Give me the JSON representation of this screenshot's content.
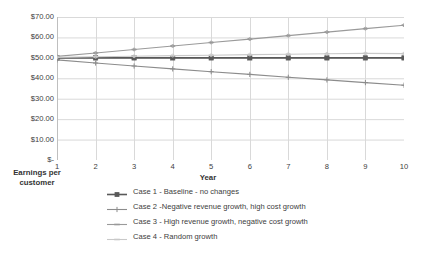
{
  "chart_data": {
    "type": "line",
    "title": "",
    "xlabel": "Year",
    "ylabel": "Earnings per customer",
    "x": [
      1,
      2,
      3,
      4,
      5,
      6,
      7,
      8,
      9,
      10
    ],
    "x_tick_labels": [
      "1",
      "2",
      "3",
      "4",
      "5",
      "6",
      "7",
      "8",
      "9",
      "10"
    ],
    "y_tick_labels": [
      "$70.00",
      "$60.00",
      "$50.00",
      "$40.00",
      "$30.00",
      "$20.00",
      "$10.00",
      "$-"
    ],
    "y_tick_values": [
      70,
      60,
      50,
      40,
      30,
      20,
      10,
      0
    ],
    "ylim": [
      0,
      70
    ],
    "xlim": [
      1,
      10
    ],
    "grid": true,
    "legend_position": "bottom",
    "series": [
      {
        "name": "Case 1 - Baseline - no changes",
        "color": "#595959",
        "marker": "square",
        "values": [
          50.0,
          50.0,
          50.0,
          50.0,
          50.0,
          50.0,
          50.0,
          50.0,
          50.0,
          50.0
        ]
      },
      {
        "name": "Case 2 -Negative revenue growth, high cost growth",
        "color": "#8c8c8c",
        "marker": "plus",
        "values": [
          49.0,
          47.5,
          46.0,
          44.6,
          43.2,
          41.9,
          40.5,
          39.2,
          37.9,
          36.6
        ]
      },
      {
        "name": "Case 3 - High revenue growth, negative cost growth",
        "color": "#9a9a9a",
        "marker": "dash",
        "values": [
          50.7,
          52.4,
          54.1,
          55.8,
          57.5,
          59.2,
          60.9,
          62.6,
          64.3,
          66.0
        ]
      },
      {
        "name": "Case 4 - Random growth",
        "color": "#c9c9c9",
        "marker": "dash",
        "values": [
          50.2,
          50.5,
          50.8,
          51.1,
          51.3,
          51.6,
          51.8,
          52.0,
          52.2,
          52.1
        ]
      }
    ]
  },
  "legend": {
    "items": [
      {
        "label": "Case 1 - Baseline - no changes"
      },
      {
        "label": "Case 2 -Negative revenue growth, high cost growth"
      },
      {
        "label": "Case 3 - High revenue growth, negative cost growth"
      },
      {
        "label": "Case 4 - Random growth"
      }
    ]
  },
  "axes": {
    "x_title": "Year",
    "y_title_line1": "Earnings per",
    "y_title_line2": "customer"
  },
  "colors": {
    "grid": "#d9d9d9",
    "axis": "#bfbfbf",
    "text": "#404040",
    "series1": "#595959",
    "series2": "#8c8c8c",
    "series3": "#9a9a9a",
    "series4": "#c9c9c9",
    "background": "#ffffff"
  }
}
